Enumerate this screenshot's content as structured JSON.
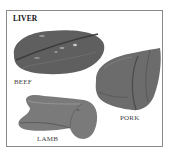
{
  "figure": {
    "title": "LIVER",
    "items": [
      {
        "label": "BEEF",
        "icon": "beef-liver-image"
      },
      {
        "label": "PORK",
        "icon": "pork-liver-image"
      },
      {
        "label": "LAMB",
        "icon": "lamb-liver-image"
      }
    ]
  },
  "colors": {
    "border": "#8a8a8a",
    "beef": "#5e5e5e",
    "pork": "#6e6e6e",
    "lamb": "#7a7a7a"
  }
}
